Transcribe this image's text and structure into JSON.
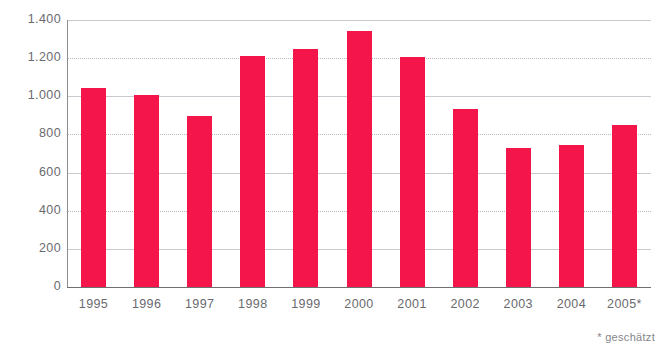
{
  "chart_data": {
    "type": "bar",
    "title": "",
    "subtitle": "",
    "xlabel": "",
    "ylabel": "",
    "categories": [
      "1995",
      "1996",
      "1997",
      "1998",
      "1999",
      "2000",
      "2001",
      "2002",
      "2003",
      "2004",
      "2005*"
    ],
    "values": [
      1045,
      1005,
      895,
      1210,
      1250,
      1340,
      1205,
      935,
      728,
      745,
      850
    ],
    "series": [
      {
        "name": "",
        "values": [
          1045,
          1005,
          895,
          1210,
          1250,
          1340,
          1205,
          935,
          728,
          745,
          850
        ]
      }
    ],
    "ylim": [
      0,
      1400
    ],
    "y_ticks": [
      0,
      200,
      400,
      600,
      800,
      1000,
      1200,
      1400
    ],
    "y_tick_labels": [
      "0",
      "200",
      "400",
      "600",
      "800",
      "1.000",
      "1.200",
      "1.400"
    ],
    "grid": true,
    "grid_axis": "y",
    "legend": false,
    "legend_position": "none",
    "bar_color": "#f4154b",
    "grid_color": "#c9c9cf",
    "axis_color": "#6f6f72",
    "text_color": "#6a6a6e",
    "background": "#ffffff",
    "annotations": [
      {
        "name": "footnote",
        "text": "* geschätzt"
      }
    ]
  },
  "footnote": {
    "text": "* geschätzt"
  }
}
